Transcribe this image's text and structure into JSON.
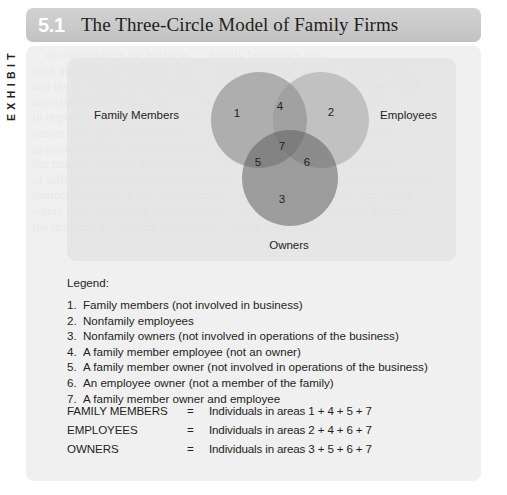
{
  "exhibit": {
    "tab_label": "EXHIBIT",
    "number": "5.1",
    "title": "The Three-Circle Model of Family Firms"
  },
  "venn": {
    "labels": {
      "family": "Family Members",
      "employees": "Employees",
      "owners": "Owners"
    },
    "regions": {
      "r1": "1",
      "r2": "2",
      "r3": "3",
      "r4": "4",
      "r5": "5",
      "r6": "6",
      "r7": "7"
    },
    "colors": {
      "family_circle": "#767676",
      "employees_circle": "#8e8e8e",
      "owners_circle": "#606060",
      "panel_background": "#e3e3e3"
    }
  },
  "legend": {
    "heading": "Legend:",
    "items": [
      {
        "num": "1.",
        "text": "Family members (not involved in business)"
      },
      {
        "num": "2.",
        "text": "Nonfamily employees"
      },
      {
        "num": "3.",
        "text": "Nonfamily owners (not involved in operations of the business)"
      },
      {
        "num": "4.",
        "text": "A family member employee (not an owner)"
      },
      {
        "num": "5.",
        "text": "A family member owner (not involved in operations of the business)"
      },
      {
        "num": "6.",
        "text": "An employee owner (not a member of the family)"
      },
      {
        "num": "7.",
        "text": "A family member owner and employee"
      }
    ]
  },
  "summary": {
    "rows": [
      {
        "label": "FAMILY MEMBERS",
        "eq": "=",
        "value": "Individuals in areas 1 + 4 + 5 + 7"
      },
      {
        "label": "EMPLOYEES",
        "eq": "=",
        "value": "Individuals in areas 2 + 4 + 6 + 7"
      },
      {
        "label": "OWNERS",
        "eq": "=",
        "value": "Individuals in areas 3 + 5 + 6 + 7"
      }
    ]
  },
  "background_bleed": {
    "text": "      of ownership in the business.     Family businesses can\n  each manages and interacts with      have long-lived, positive customer rela-\n  and the problems and opportunities     tionships where individuals know and\n  associated with each group.          trust each other. The employee-cus-\n  to impose a structure on the busi-     tomer bond is often built in the business\n  nesses a complex set of relation-     ships and provide the company the\n  as possible to have both well-defined     business.\n  but must monitor the boundaries      well below a desired threshold and\n  of selling family-held shares to outside     parties, achieve a balance of outside\n  business ownership within the family     and over time as families grow and\n  where decision-making power is con-     centrated in relatively few hands.\n  the structure. Even in the process of     a new generation"
  }
}
